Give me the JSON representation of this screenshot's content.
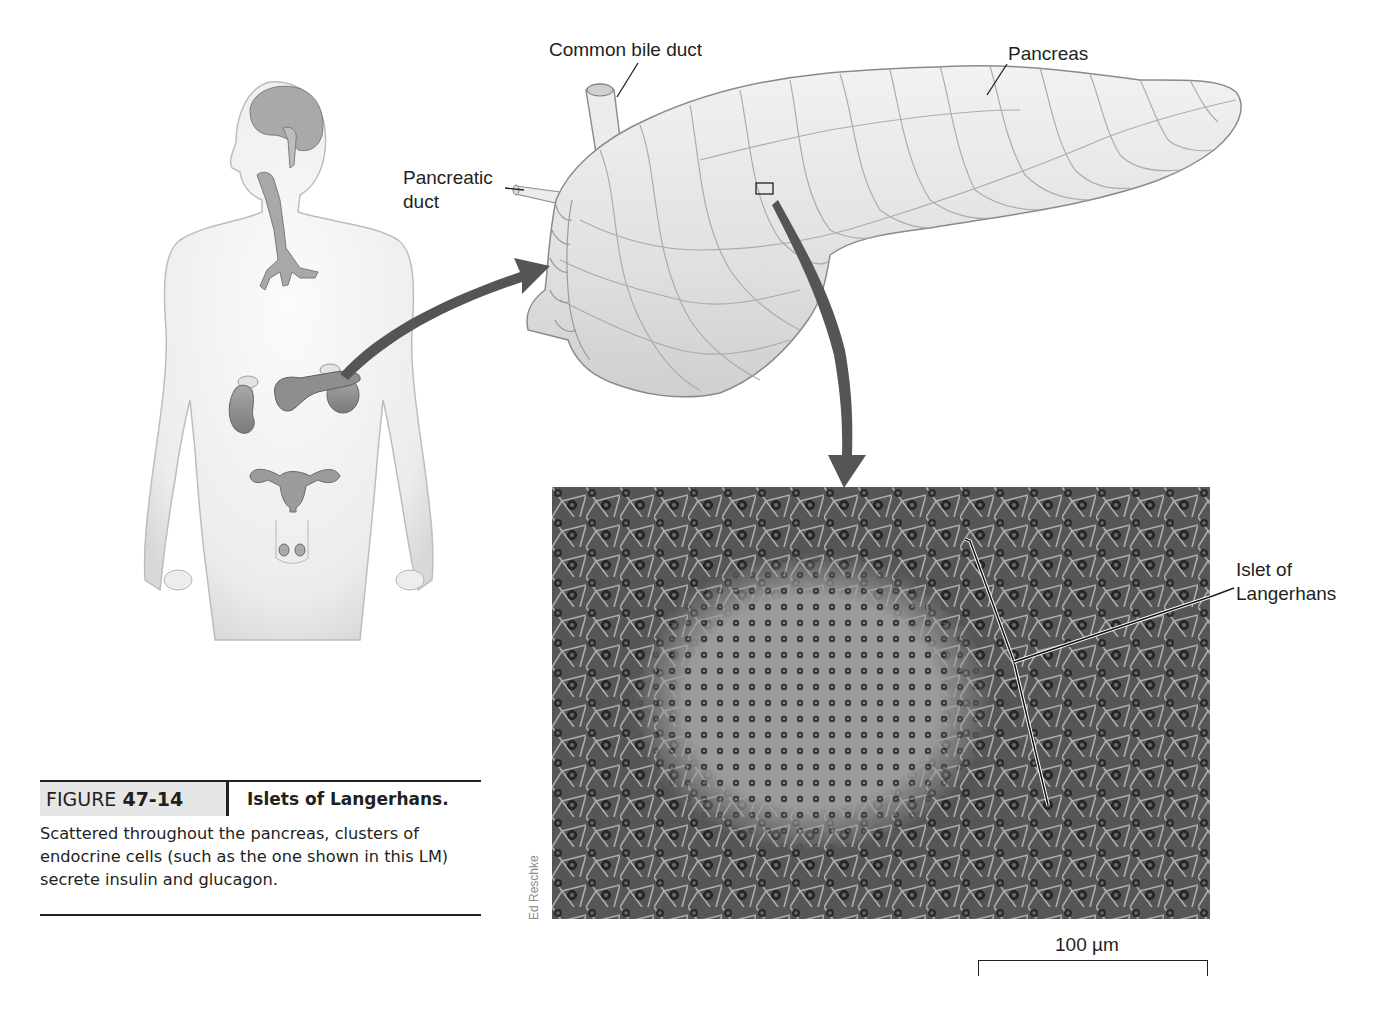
{
  "figure": {
    "number_prefix": "FIGURE",
    "number": "47-14",
    "title": "Islets of Langerhans.",
    "caption": "Scattered throughout the pancreas, clusters of endocrine cells (such as the one shown in this LM) secrete insulin and glucagon."
  },
  "labels": {
    "common_bile_duct": "Common bile duct",
    "pancreas": "Pancreas",
    "pancreatic_duct_line1": "Pancreatic",
    "pancreatic_duct_line2": "duct",
    "islet_line1": "Islet of",
    "islet_line2": "Langerhans"
  },
  "micrograph": {
    "credit": "Ed Reschke",
    "scale_bar_label": "100 µm"
  },
  "colors": {
    "text": "#231f20",
    "arrow": "#555555",
    "caption_band": "#e6e6e6",
    "micrograph_bg": "#5b5b5b",
    "islet_tint": "#9a9a9a"
  }
}
